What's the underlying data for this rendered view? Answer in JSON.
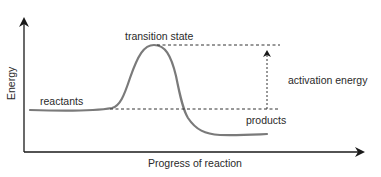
{
  "diagram": {
    "type": "reaction-energy-profile",
    "axes": {
      "y_label": "Energy",
      "x_label": "Progress of reaction"
    },
    "labels": {
      "transition_state": "transition state",
      "reactants": "reactants",
      "products": "products",
      "activation_energy": "activation energy"
    },
    "colors": {
      "axis": "#1a1a1a",
      "curve": "#7a7a7a",
      "dashed": "#333333",
      "text": "#2a2a2a",
      "background": "#ffffff"
    },
    "levels": {
      "reactants_energy": "low-mid",
      "transition_state_energy": "high",
      "products_energy": "low"
    }
  }
}
